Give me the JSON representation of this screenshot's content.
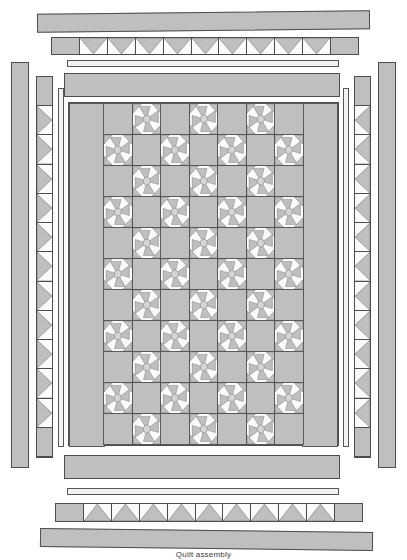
{
  "diagram": {
    "caption": "Quilt assembly",
    "colors": {
      "fabric_gray": "#bfbfbf",
      "fabric_light": "#fbfbfb",
      "outline": "#4d4d4d",
      "grid_line": "#595959",
      "background": "#ffffff"
    }
  },
  "quilt_center": {
    "name": "quilt center",
    "columns": 7,
    "rows": 11,
    "block_names": [
      "pinwheel block",
      "plain square"
    ],
    "side_border_label": "side border",
    "layout": [
      [
        "plain",
        "pinwheel",
        "plain",
        "pinwheel",
        "plain",
        "pinwheel",
        "plain"
      ],
      [
        "pinwheel",
        "plain",
        "pinwheel",
        "plain",
        "pinwheel",
        "plain",
        "pinwheel"
      ],
      [
        "plain",
        "pinwheel",
        "plain",
        "pinwheel",
        "plain",
        "pinwheel",
        "plain"
      ],
      [
        "pinwheel",
        "plain",
        "pinwheel",
        "plain",
        "pinwheel",
        "plain",
        "pinwheel"
      ],
      [
        "plain",
        "pinwheel",
        "plain",
        "pinwheel",
        "plain",
        "pinwheel",
        "plain"
      ],
      [
        "pinwheel",
        "plain",
        "pinwheel",
        "plain",
        "pinwheel",
        "plain",
        "pinwheel"
      ],
      [
        "plain",
        "pinwheel",
        "plain",
        "pinwheel",
        "plain",
        "pinwheel",
        "plain"
      ],
      [
        "pinwheel",
        "plain",
        "pinwheel",
        "plain",
        "pinwheel",
        "plain",
        "pinwheel"
      ],
      [
        "plain",
        "pinwheel",
        "plain",
        "pinwheel",
        "plain",
        "pinwheel",
        "plain"
      ],
      [
        "pinwheel",
        "plain",
        "pinwheel",
        "plain",
        "pinwheel",
        "plain",
        "pinwheel"
      ],
      [
        "plain",
        "pinwheel",
        "plain",
        "pinwheel",
        "plain",
        "pinwheel",
        "plain"
      ]
    ]
  },
  "borders": {
    "top_outer_bar": {
      "label": "top outer border strip",
      "type": "plain"
    },
    "top_sawtooth": {
      "label": "top sawtooth border",
      "triangles": 9,
      "direction": "down"
    },
    "top_thin_bar": {
      "label": "top narrow inner strip",
      "type": "narrow"
    },
    "top_inner_bar": {
      "label": "top inner border strip",
      "type": "plain"
    },
    "bottom_inner_bar": {
      "label": "bottom inner border strip",
      "type": "plain"
    },
    "bottom_thin_bar": {
      "label": "bottom narrow inner strip",
      "type": "narrow"
    },
    "bottom_sawtooth": {
      "label": "bottom sawtooth border",
      "triangles": 9,
      "direction": "up"
    },
    "bottom_outer_bar": {
      "label": "bottom outer border strip",
      "type": "plain"
    },
    "left_outer_bar": {
      "label": "left outer border strip",
      "type": "plain"
    },
    "left_sawtooth": {
      "label": "left sawtooth border",
      "triangles": 11,
      "direction": "right"
    },
    "left_thin_bar": {
      "label": "left narrow inner strip",
      "type": "narrow"
    },
    "right_thin_bar": {
      "label": "right narrow inner strip",
      "type": "narrow"
    },
    "right_sawtooth": {
      "label": "right sawtooth border",
      "triangles": 11,
      "direction": "left"
    },
    "right_outer_bar": {
      "label": "right outer border strip",
      "type": "plain"
    },
    "corner_top_left": {
      "label": "top left corner square"
    },
    "corner_top_right": {
      "label": "top right corner square"
    },
    "corner_bottom_left": {
      "label": "bottom left corner square"
    },
    "corner_bottom_right": {
      "label": "bottom right corner square"
    }
  }
}
